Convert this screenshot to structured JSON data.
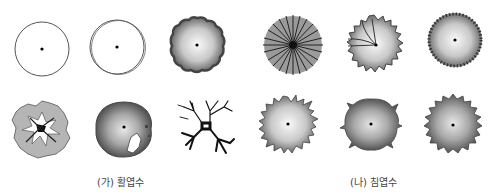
{
  "groups": [
    {
      "label": "(가) 활엽수",
      "meaning": "broadleaf trees",
      "symbols": [
        {
          "name": "simple-circle"
        },
        {
          "name": "double-circle"
        },
        {
          "name": "shaded-scalloped-circle"
        },
        {
          "name": "irregular-foliage-with-branches"
        },
        {
          "name": "shaded-circle-with-trunk"
        },
        {
          "name": "branch-silhouette"
        }
      ]
    },
    {
      "label": "(나) 침엽수",
      "meaning": "coniferous trees",
      "symbols": [
        {
          "name": "radial-lines-circle"
        },
        {
          "name": "spiky-circle-with-branch-lines"
        },
        {
          "name": "shaded-circle-with-tick-edge"
        },
        {
          "name": "spiky-shaded-circle"
        },
        {
          "name": "sparse-spiky-shaded-circle"
        },
        {
          "name": "star-edge-shaded-circle"
        }
      ]
    }
  ],
  "colors": {
    "line": "#444444",
    "fill_dark": "#6a6a6a",
    "fill_light": "#f4f4f4"
  }
}
